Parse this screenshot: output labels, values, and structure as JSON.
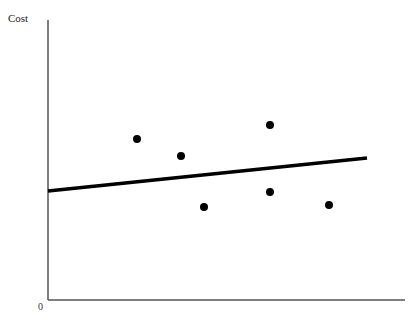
{
  "chart_data": {
    "type": "scatter",
    "title": "",
    "xlabel": "",
    "ylabel": "Cost",
    "origin_label": "0",
    "grid": false,
    "legend": null,
    "axis_ranges_px": {
      "x0": 48,
      "x1": 405,
      "y0": 300,
      "y1": 20
    },
    "points_px": [
      {
        "x": 137,
        "y": 139
      },
      {
        "x": 181,
        "y": 156
      },
      {
        "x": 204,
        "y": 207
      },
      {
        "x": 270,
        "y": 125
      },
      {
        "x": 270,
        "y": 192
      },
      {
        "x": 329,
        "y": 205
      }
    ],
    "points_normalized": [
      {
        "x": 0.25,
        "y": 0.575
      },
      {
        "x": 0.37,
        "y": 0.515
      },
      {
        "x": 0.44,
        "y": 0.33
      },
      {
        "x": 0.62,
        "y": 0.625
      },
      {
        "x": 0.62,
        "y": 0.385
      },
      {
        "x": 0.79,
        "y": 0.34
      }
    ],
    "trend_line_px": {
      "x1": 48,
      "y1": 191,
      "x2": 367,
      "y2": 158
    },
    "trend_line_normalized": {
      "x1": 0.0,
      "y1": 0.39,
      "x2": 0.89,
      "y2": 0.51
    },
    "colors": {
      "axis": "#555555",
      "points": "#000000",
      "line": "#000000"
    }
  }
}
